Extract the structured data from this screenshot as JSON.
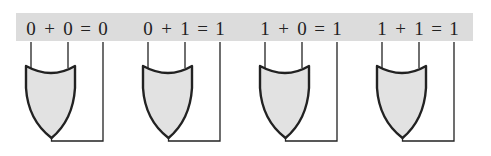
{
  "diagram": {
    "band_color": "#dcdcdc",
    "gate_fill": "#e2e2e2",
    "line_color": "#222222",
    "gates": [
      {
        "id": "gate-1",
        "a": "0",
        "b": "0",
        "result": "0",
        "equation": "0 + 0 = 0",
        "x": 26
      },
      {
        "id": "gate-2",
        "a": "0",
        "b": "1",
        "result": "1",
        "equation": "0 + 1 = 1",
        "x": 143
      },
      {
        "id": "gate-3",
        "a": "1",
        "b": "0",
        "result": "1",
        "equation": "1 + 0 = 1",
        "x": 260
      },
      {
        "id": "gate-4",
        "a": "1",
        "b": "1",
        "result": "1",
        "equation": "1 + 1 = 1",
        "x": 377
      }
    ],
    "symbols": {
      "plus": "+",
      "equals": "="
    }
  }
}
